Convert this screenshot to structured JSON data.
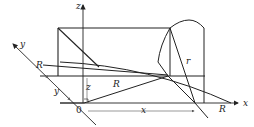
{
  "figure": {
    "type": "geometry-diagram",
    "labels": {
      "z_axis": "z",
      "y_axis": "y",
      "x_axis": "x",
      "origin": "0",
      "R_left": "R",
      "R_middle": "R",
      "R_xaxis": "R",
      "r": "r",
      "y_dim": "y",
      "z_dim": "z",
      "x_dim": "x"
    },
    "colors": {
      "line": "#222222",
      "thin": "#555555",
      "background": "#ffffff"
    }
  }
}
